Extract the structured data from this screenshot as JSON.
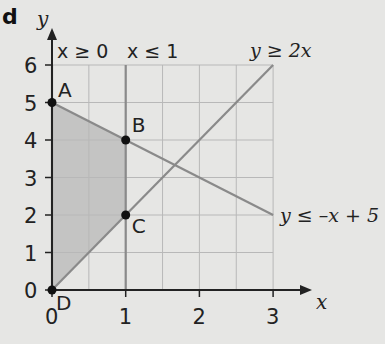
{
  "part_label": "d",
  "chart_data": {
    "type": "line",
    "title": "",
    "xlabel": "x",
    "ylabel": "y",
    "xlim": [
      0,
      3
    ],
    "ylim": [
      0,
      6
    ],
    "x_ticks": [
      0,
      1,
      2,
      3
    ],
    "y_ticks": [
      0,
      1,
      2,
      3,
      4,
      5,
      6
    ],
    "grid": true,
    "lines": [
      {
        "label": "x ≥ 0",
        "points": [
          [
            0,
            0
          ],
          [
            0,
            6
          ]
        ]
      },
      {
        "label": "x ≤ 1",
        "points": [
          [
            1,
            0
          ],
          [
            1,
            6
          ]
        ]
      },
      {
        "label": "y ≥ 2x",
        "points": [
          [
            0,
            0
          ],
          [
            3,
            6
          ]
        ]
      },
      {
        "label": "y ≤ –x + 5",
        "points": [
          [
            0,
            5
          ],
          [
            3,
            2
          ]
        ]
      }
    ],
    "shaded_region": [
      [
        0,
        0
      ],
      [
        0,
        5
      ],
      [
        1,
        4
      ],
      [
        1,
        2
      ]
    ],
    "points": [
      {
        "label": "A",
        "x": 0,
        "y": 5
      },
      {
        "label": "B",
        "x": 1,
        "y": 4
      },
      {
        "label": "C",
        "x": 1,
        "y": 2
      },
      {
        "label": "D",
        "x": 0,
        "y": 0
      }
    ]
  },
  "colors": {
    "line": "#8a8a8a",
    "axis": "#222222",
    "grid": "#b8b8b8",
    "shade": "#bdbdbd",
    "background": "#e6e6e4"
  }
}
